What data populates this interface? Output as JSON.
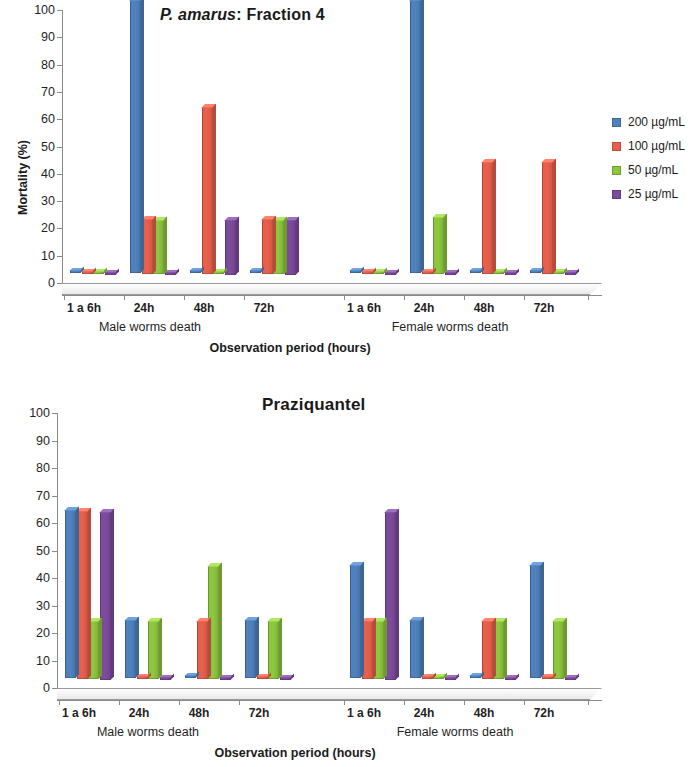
{
  "figure": {
    "y_axis_label": "Mortality (%)",
    "x_axis_title": "Observation period (hours)",
    "group_labels": [
      "Male worms death",
      "Female worms death"
    ],
    "categories": [
      "1 a 6h",
      "24h",
      "48h",
      "72h"
    ],
    "y_ticks": [
      "0",
      "10",
      "20",
      "30",
      "40",
      "50",
      "60",
      "70",
      "80",
      "90",
      "100"
    ],
    "colors": {
      "series_200": "#4F81BD",
      "series_100": "#E8604C",
      "series_50": "#8DC63F",
      "series_25": "#7D4B9E"
    },
    "legend": [
      {
        "label": "200 µg/mL",
        "color": "#4F81BD"
      },
      {
        "label": "100 µg/mL",
        "color": "#E8604C"
      },
      {
        "label": "50 µg/mL",
        "color": "#8DC63F"
      },
      {
        "label": "25 µg/mL",
        "color": "#7D4B9E"
      }
    ]
  },
  "chart_data": [
    {
      "type": "bar",
      "title": "P. amarus: Fraction 4",
      "title_italic_part": "P. amarus",
      "title_rest": ": Fraction 4",
      "xlabel": "Observation period (hours)",
      "ylabel": "Mortality (%)",
      "ylim": [
        0,
        100
      ],
      "ytick_step": 10,
      "grid": false,
      "legend_position": "right",
      "groups": [
        "Male worms death",
        "Female worms death"
      ],
      "categories": [
        "1 a 6h",
        "24h",
        "48h",
        "72h",
        "1 a 6h",
        "24h",
        "48h",
        "72h"
      ],
      "series": [
        {
          "name": "200 µg/mL",
          "color": "#4F81BD",
          "values": [
            0,
            100,
            0,
            0,
            0,
            100,
            0,
            0
          ]
        },
        {
          "name": "100 µg/mL",
          "color": "#E8604C",
          "values": [
            0,
            20,
            61,
            20,
            0,
            0,
            41,
            41
          ]
        },
        {
          "name": "50 µg/mL",
          "color": "#8DC63F",
          "values": [
            0,
            20,
            0,
            20,
            0,
            21,
            0,
            0
          ]
        },
        {
          "name": "25 µg/mL",
          "color": "#7D4B9E",
          "values": [
            0,
            0,
            20,
            20,
            0,
            0,
            0,
            0
          ]
        }
      ]
    },
    {
      "type": "bar",
      "title": "Praziquantel",
      "xlabel": "Observation period (hours)",
      "ylabel": "Mortality (%)",
      "ylim": [
        0,
        100
      ],
      "ytick_step": 10,
      "grid": false,
      "legend_position": "right",
      "groups": [
        "Male worms death",
        "Female worms death"
      ],
      "categories": [
        "1 a 6h",
        "24h",
        "48h",
        "72h",
        "1 a 6h",
        "24h",
        "48h",
        "72h"
      ],
      "series": [
        {
          "name": "200 µg/mL",
          "color": "#4F81BD",
          "values": [
            61,
            21,
            0,
            21,
            41,
            21,
            0,
            41
          ]
        },
        {
          "name": "100 µg/mL",
          "color": "#E8604C",
          "values": [
            61,
            0,
            21,
            0,
            21,
            0,
            21,
            0
          ]
        },
        {
          "name": "50 µg/mL",
          "color": "#8DC63F",
          "values": [
            21,
            21,
            41,
            21,
            21,
            0,
            21,
            21
          ]
        },
        {
          "name": "25 µg/mL",
          "color": "#7D4B9E",
          "values": [
            61,
            0,
            0,
            0,
            61,
            0,
            0,
            0
          ]
        }
      ]
    }
  ]
}
